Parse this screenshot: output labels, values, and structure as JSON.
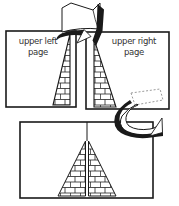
{
  "canvas": {
    "width": 179,
    "height": 206,
    "background": "#ffffff",
    "ink_color": "#1a1a1a",
    "text_color": "#333333",
    "dashed_color": "#909090"
  },
  "labels": {
    "upper_left": {
      "line1": "upper left",
      "line2": "page"
    },
    "upper_right": {
      "line1": "upper right",
      "line2": "page"
    }
  },
  "icons": {
    "top_arrow": "page-turn-arrow",
    "right_arrow": "page-turn-arrow",
    "pattern": "brick-wall-pattern"
  },
  "figures": {
    "upper_left_page": "left half of brick pyramid at right edge",
    "upper_right_page": "right half of brick pyramid at left edge",
    "bottom_spread": "complete brick pyramid across center fold"
  }
}
